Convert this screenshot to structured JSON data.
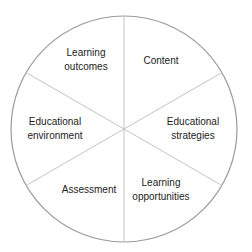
{
  "diagram": {
    "type": "circle-six-segments",
    "center": [
      124,
      129
    ],
    "radius": 113,
    "stroke_color": "#9a9a9a",
    "divider_color": "#c4c4c4",
    "text_color": "#222222",
    "segments": [
      {
        "name": "learning-outcomes",
        "lines": [
          "Learning",
          "outcomes"
        ],
        "x": 86,
        "y": [
          53,
          67
        ]
      },
      {
        "name": "content",
        "lines": [
          "Content"
        ],
        "x": 161,
        "y": [
          63
        ]
      },
      {
        "name": "educational-strategies",
        "lines": [
          "Educational",
          "strategies"
        ],
        "x": 193,
        "y": [
          124,
          138
        ]
      },
      {
        "name": "learning-opportunities",
        "lines": [
          "Learning",
          "opportunities"
        ],
        "x": 161,
        "y": [
          185,
          199
        ]
      },
      {
        "name": "assessment",
        "lines": [
          "Assessment"
        ],
        "x": 89,
        "y": [
          192
        ]
      },
      {
        "name": "educational-environment",
        "lines": [
          "Educational",
          "environment"
        ],
        "x": 55,
        "y": [
          124,
          138
        ]
      }
    ]
  }
}
